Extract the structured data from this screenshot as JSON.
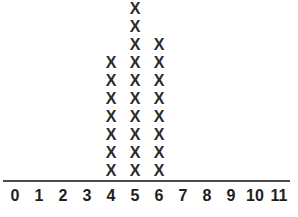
{
  "chart_data": {
    "type": "bar",
    "title": "",
    "subtitle": "",
    "xlabel": "",
    "ylabel": "",
    "mark_glyph": "X",
    "grid": false,
    "legend": false,
    "axis_color": "#4a4a4a",
    "mark_color": "#2b2b2b",
    "label_color": "#1e1e1e",
    "background_color": "#ffffff",
    "xlim": [
      0,
      11
    ],
    "ylim": [
      0,
      10
    ],
    "categories": [
      "0",
      "1",
      "2",
      "3",
      "4",
      "5",
      "6",
      "7",
      "8",
      "9",
      "10",
      "11"
    ],
    "values": [
      0,
      0,
      0,
      0,
      7,
      10,
      8,
      0,
      0,
      0,
      0,
      0
    ],
    "tick_labels": [
      "0",
      "1",
      "2",
      "3",
      "4",
      "5",
      "6",
      "7",
      "8",
      "9",
      "10",
      "11"
    ],
    "annotations": []
  },
  "axis": {
    "tick_labels": [
      "0",
      "1",
      "2",
      "3",
      "4",
      "5",
      "6",
      "7",
      "8",
      "9",
      "10",
      "11"
    ]
  }
}
